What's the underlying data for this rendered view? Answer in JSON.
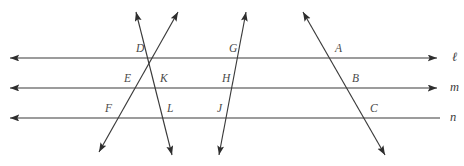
{
  "figure": {
    "type": "geometry-diagram",
    "width": 464,
    "height": 166,
    "background_color": "#ffffff",
    "stroke_color": "#3a3a3a",
    "label_color": "#4a4a4a"
  },
  "parallel_lines": [
    {
      "id": "line-l",
      "label": "ℓ",
      "label_x": 452,
      "label_y": 61,
      "x1": 10,
      "y1": 58,
      "x2": 437,
      "y2": 58,
      "arrow_start": true,
      "arrow_end": true
    },
    {
      "id": "line-m",
      "label": "m",
      "label_x": 450,
      "label_y": 91,
      "x1": 10,
      "y1": 88,
      "x2": 437,
      "y2": 88,
      "arrow_start": true,
      "arrow_end": true
    },
    {
      "id": "line-n",
      "label": "n",
      "label_x": 450,
      "label_y": 121,
      "x1": 10,
      "y1": 118,
      "x2": 440,
      "y2": 118,
      "arrow_start": true,
      "arrow_end": false
    }
  ],
  "transversals": [
    {
      "id": "transversal-1",
      "description": "left-leaning transversal through D, K, L",
      "x1": 136,
      "y1": 12,
      "x2": 172,
      "y2": 155,
      "arrow_start": true,
      "arrow_end": true
    },
    {
      "id": "transversal-2",
      "description": "right-leaning transversal through F, E, D",
      "x1": 178,
      "y1": 12,
      "x2": 99,
      "y2": 152,
      "arrow_start": true,
      "arrow_end": true
    },
    {
      "id": "transversal-3",
      "description": "near-vertical transversal through G, H, J",
      "x1": 246,
      "y1": 12,
      "x2": 219,
      "y2": 155,
      "arrow_start": true,
      "arrow_end": true
    },
    {
      "id": "transversal-4",
      "description": "right-leaning transversal through A, B, C",
      "x1": 303,
      "y1": 12,
      "x2": 385,
      "y2": 155,
      "arrow_start": true,
      "arrow_end": true
    }
  ],
  "points": [
    {
      "id": "point-D",
      "label": "D",
      "x": 136,
      "y": 52,
      "on_line": "ℓ"
    },
    {
      "id": "point-G",
      "label": "G",
      "x": 229,
      "y": 52,
      "on_line": "ℓ"
    },
    {
      "id": "point-A",
      "label": "A",
      "x": 335,
      "y": 52,
      "on_line": "ℓ"
    },
    {
      "id": "point-E",
      "label": "E",
      "x": 124,
      "y": 82,
      "on_line": "m"
    },
    {
      "id": "point-K",
      "label": "K",
      "x": 160,
      "y": 82,
      "on_line": "m"
    },
    {
      "id": "point-H",
      "label": "H",
      "x": 222,
      "y": 82,
      "on_line": "m"
    },
    {
      "id": "point-B",
      "label": "B",
      "x": 352,
      "y": 82,
      "on_line": "m"
    },
    {
      "id": "point-F",
      "label": "F",
      "x": 105,
      "y": 112,
      "on_line": "n"
    },
    {
      "id": "point-L",
      "label": "L",
      "x": 167,
      "y": 112,
      "on_line": "n"
    },
    {
      "id": "point-J",
      "label": "J",
      "x": 217,
      "y": 112,
      "on_line": "n"
    },
    {
      "id": "point-C",
      "label": "C",
      "x": 370,
      "y": 112,
      "on_line": "n"
    }
  ]
}
